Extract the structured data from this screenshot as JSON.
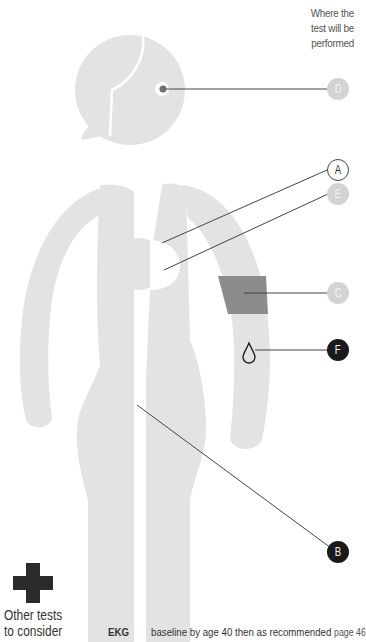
{
  "header": {
    "note": "Where the test will be performed"
  },
  "colors": {
    "body_fill": "#e3e3e3",
    "highlight_band": "#8c8c8c",
    "leader_line": "#444444",
    "callout_dark": "#1a1a1a",
    "callout_light": "#d3d3d3"
  },
  "callouts": [
    {
      "id": "D",
      "label": "D",
      "style": "light",
      "target": "eye"
    },
    {
      "id": "A",
      "label": "A",
      "style": "outline",
      "target": "breast-upper"
    },
    {
      "id": "E",
      "label": "E",
      "style": "light",
      "target": "breast-lower"
    },
    {
      "id": "C",
      "label": "C",
      "style": "light",
      "target": "upper-arm-band"
    },
    {
      "id": "F",
      "label": "F",
      "style": "dark",
      "target": "forearm-blood-drop"
    },
    {
      "id": "B",
      "label": "B",
      "style": "dark",
      "target": "pelvis"
    }
  ],
  "icons": {
    "blood_drop": "drop-icon",
    "plus": "plus-icon"
  },
  "other_tests": {
    "label_line1": "Other tests",
    "label_line2": "to consider",
    "items": [
      {
        "name": "EKG",
        "description": "baseline by age 40 then as recommended",
        "page_ref": "page 46"
      }
    ]
  }
}
